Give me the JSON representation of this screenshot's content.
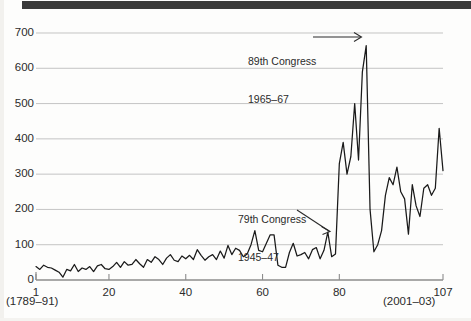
{
  "figure": {
    "background_color": "#fdfdfc",
    "top_bar_color": "#3a3a3a",
    "line_color": "#1a1a1a",
    "grid_color": "#b9b9b9",
    "axis_color": "#8c8c8c",
    "text_color": "#2b2b2b"
  },
  "axis": {
    "x_start_label": "1",
    "x_start_sub": "(1789–91)",
    "x_end_label": "107",
    "x_end_sub": "(2001–03)"
  },
  "annotations": [
    {
      "id": "congress-89",
      "line1": "89th Congress",
      "line2": "1965–67",
      "arrow": "horizontal-right"
    },
    {
      "id": "congress-79",
      "line1": "79th Congress",
      "line2": "1945–47",
      "arrow": "diagonal-down-right"
    }
  ],
  "chart_data": {
    "type": "line",
    "title": "",
    "xlabel": "",
    "ylabel": "",
    "xlim": [
      1,
      107
    ],
    "ylim": [
      0,
      700
    ],
    "grid": true,
    "legend": null,
    "yticks": [
      0,
      100,
      200,
      300,
      400,
      500,
      600,
      700
    ],
    "ytick_labels": [
      "0",
      "100",
      "200",
      "300",
      "400",
      "500",
      "600",
      "700"
    ],
    "xticks": [
      1,
      20,
      40,
      60,
      80,
      107
    ],
    "xtick_labels": [
      "1",
      "20",
      "40",
      "60",
      "80",
      "107"
    ],
    "x": [
      1,
      2,
      3,
      4,
      5,
      6,
      7,
      8,
      9,
      10,
      11,
      12,
      13,
      14,
      15,
      16,
      17,
      18,
      19,
      20,
      21,
      22,
      23,
      24,
      25,
      26,
      27,
      28,
      29,
      30,
      31,
      32,
      33,
      34,
      35,
      36,
      37,
      38,
      39,
      40,
      41,
      42,
      43,
      44,
      45,
      46,
      47,
      48,
      49,
      50,
      51,
      52,
      53,
      54,
      55,
      56,
      57,
      58,
      59,
      60,
      61,
      62,
      63,
      64,
      65,
      66,
      67,
      68,
      69,
      70,
      71,
      72,
      73,
      74,
      75,
      76,
      77,
      78,
      79,
      80,
      81,
      82,
      83,
      84,
      85,
      86,
      87,
      88,
      89,
      90,
      91,
      92,
      93,
      94,
      95,
      96,
      97,
      98,
      99,
      100,
      101,
      102,
      103,
      104,
      105,
      106,
      107
    ],
    "values": [
      38,
      30,
      42,
      36,
      34,
      28,
      22,
      8,
      30,
      26,
      44,
      24,
      34,
      30,
      38,
      24,
      40,
      44,
      32,
      30,
      38,
      50,
      36,
      52,
      42,
      44,
      58,
      46,
      36,
      58,
      50,
      66,
      58,
      44,
      62,
      72,
      56,
      52,
      68,
      60,
      70,
      58,
      86,
      70,
      56,
      66,
      72,
      58,
      82,
      62,
      98,
      72,
      90,
      84,
      66,
      74,
      100,
      140,
      84,
      80,
      104,
      128,
      128,
      42,
      36,
      36,
      78,
      104,
      68,
      72,
      78,
      60,
      86,
      92,
      60,
      84,
      136,
      66,
      74,
      330,
      390,
      300,
      350,
      500,
      340,
      590,
      664,
      200,
      80,
      100,
      140,
      240,
      290,
      270,
      320,
      250,
      230,
      130,
      270,
      210,
      180,
      260,
      270,
      240,
      260,
      430,
      310
    ],
    "series": [
      {
        "name": "Public laws enacted per Congress",
        "values": [
          38,
          30,
          42,
          36,
          34,
          28,
          22,
          8,
          30,
          26,
          44,
          24,
          34,
          30,
          38,
          24,
          40,
          44,
          32,
          30,
          38,
          50,
          36,
          52,
          42,
          44,
          58,
          46,
          36,
          58,
          50,
          66,
          58,
          44,
          62,
          72,
          56,
          52,
          68,
          60,
          70,
          58,
          86,
          70,
          56,
          66,
          72,
          58,
          82,
          62,
          98,
          72,
          90,
          84,
          66,
          74,
          100,
          140,
          84,
          80,
          104,
          128,
          128,
          42,
          36,
          36,
          78,
          104,
          68,
          72,
          78,
          60,
          86,
          92,
          60,
          84,
          136,
          66,
          74,
          330,
          390,
          300,
          350,
          500,
          340,
          590,
          664,
          200,
          80,
          100,
          140,
          240,
          290,
          270,
          320,
          250,
          230,
          130,
          270,
          210,
          180,
          260,
          270,
          240,
          260,
          430,
          310
        ]
      }
    ],
    "annotated_points": [
      {
        "x": 89,
        "y": 664,
        "label": "89th Congress 1965–67"
      },
      {
        "x": 80,
        "y": 330,
        "label": "79th Congress 1945–47"
      }
    ]
  }
}
